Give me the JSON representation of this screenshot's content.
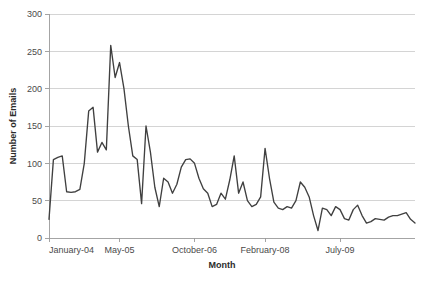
{
  "chart_data": {
    "type": "line",
    "title": "",
    "xlabel": "Month",
    "ylabel": "Number of Emails",
    "ylim": [
      0,
      300
    ],
    "ytick_values": [
      0,
      50,
      100,
      150,
      200,
      250,
      300
    ],
    "ytick_labels": [
      "0",
      "50",
      "100",
      "150",
      "200",
      "250",
      "300"
    ],
    "xtick_labels": [
      "January-04",
      "May-05",
      "October-06",
      "February-08",
      "July-09"
    ],
    "xtick_indices": [
      0,
      16,
      33,
      49,
      66
    ],
    "grid": "horizontal",
    "legend": "none",
    "line_color": "#404040",
    "series": [
      {
        "name": "Number of Emails",
        "values": [
          25,
          105,
          108,
          110,
          62,
          61,
          62,
          65,
          100,
          170,
          175,
          115,
          128,
          118,
          258,
          215,
          235,
          200,
          150,
          110,
          105,
          46,
          150,
          115,
          68,
          42,
          80,
          75,
          60,
          72,
          95,
          105,
          106,
          100,
          80,
          66,
          60,
          42,
          45,
          60,
          52,
          78,
          110,
          60,
          75,
          50,
          42,
          45,
          55,
          120,
          80,
          48,
          40,
          38,
          42,
          40,
          50,
          75,
          68,
          55,
          30,
          10,
          40,
          38,
          30,
          42,
          38,
          26,
          24,
          38,
          44,
          30,
          20,
          22,
          26,
          25,
          24,
          28,
          30,
          30,
          32,
          34,
          25,
          20
        ]
      }
    ]
  },
  "axes": {
    "x_title": "Month",
    "y_title": "Number of Emails"
  }
}
